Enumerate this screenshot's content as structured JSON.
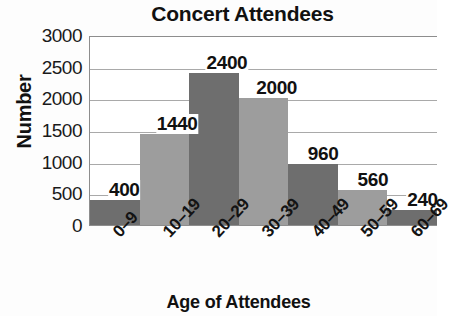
{
  "chart_data": {
    "type": "bar",
    "title": "Concert Attendees",
    "xlabel": "Age of Attendees",
    "ylabel": "Number",
    "categories": [
      "0–9",
      "10–19",
      "20–29",
      "30–39",
      "40–49",
      "50–59",
      "60–69"
    ],
    "values": [
      400,
      1440,
      2400,
      2000,
      960,
      560,
      240
    ],
    "value_labels": [
      "400",
      "1440",
      "2400",
      "2000",
      "960",
      "560",
      "240"
    ],
    "ylim": [
      0,
      3000
    ],
    "y_ticks": [
      3000,
      2500,
      2000,
      1500,
      1000,
      500,
      0
    ],
    "y_tick_labels": [
      "3000",
      "2500",
      "2000",
      "1500",
      "1000",
      "500",
      "0"
    ],
    "grid": true,
    "grid_axis": "y",
    "legend": false,
    "bar_colors": [
      "#6e6e6e",
      "#9d9d9d",
      "#6e6e6e",
      "#9d9d9d",
      "#6e6e6e",
      "#9d9d9d",
      "#6e6e6e"
    ],
    "colors": {
      "bar_dark": "#6e6e6e",
      "bar_light": "#9d9d9d",
      "gridline": "#a9a9a9",
      "axis": "#8d8d8d",
      "text": "#111111",
      "background": "#ffffff"
    }
  }
}
